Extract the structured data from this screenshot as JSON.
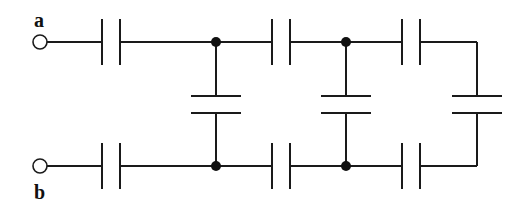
{
  "diagram": {
    "type": "capacitor-ladder-network",
    "terminals": [
      {
        "id": "a",
        "label": "a",
        "x": 40,
        "y": 42
      },
      {
        "id": "b",
        "label": "b",
        "x": 40,
        "y": 166
      }
    ],
    "stroke_color": "#1a1a1a",
    "series_capacitors_top": [
      {
        "x1": 102,
        "x2": 120,
        "y": 42
      },
      {
        "x1": 272,
        "x2": 290,
        "y": 42
      },
      {
        "x1": 402,
        "x2": 420,
        "y": 42
      }
    ],
    "series_capacitors_bottom": [
      {
        "x1": 102,
        "x2": 120,
        "y": 166
      },
      {
        "x1": 272,
        "x2": 290,
        "y": 166
      },
      {
        "x1": 402,
        "x2": 420,
        "y": 166
      }
    ],
    "shunt_capacitors": [
      {
        "x": 216,
        "y1": 96,
        "y2": 113
      },
      {
        "x": 346,
        "y1": 96,
        "y2": 113
      },
      {
        "x": 477,
        "y1": 96,
        "y2": 113
      }
    ],
    "junction_nodes": [
      {
        "x": 216,
        "y": 42
      },
      {
        "x": 346,
        "y": 42
      },
      {
        "x": 216,
        "y": 166
      },
      {
        "x": 346,
        "y": 166
      }
    ]
  }
}
